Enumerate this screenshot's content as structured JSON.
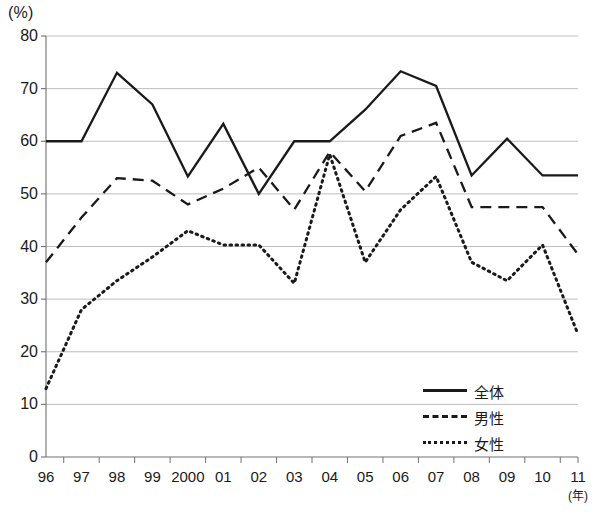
{
  "axis": {
    "y_unit": "(%)",
    "x_unit": "(年)",
    "y_ticks": [
      "80",
      "70",
      "60",
      "50",
      "40",
      "30",
      "20",
      "10",
      "0"
    ],
    "x_ticks": [
      "96",
      "97",
      "98",
      "99",
      "2000",
      "01",
      "02",
      "03",
      "04",
      "05",
      "06",
      "07",
      "08",
      "09",
      "10",
      "11"
    ]
  },
  "legend": {
    "items": [
      {
        "label": "全体",
        "style": "solid"
      },
      {
        "label": "男性",
        "style": "dashed"
      },
      {
        "label": "女性",
        "style": "dotted"
      }
    ]
  },
  "colors": {
    "line": "#1a1a1a",
    "grid": "#b5b5b5",
    "axis": "#707070",
    "background": "#ffffff"
  },
  "chart_data": {
    "type": "line",
    "title": "",
    "xlabel": "(年)",
    "ylabel": "(%)",
    "xlim": [
      0,
      15
    ],
    "ylim": [
      0,
      80
    ],
    "grid": true,
    "legend_position": "inside-lower-right",
    "categories": [
      "96",
      "97",
      "98",
      "99",
      "2000",
      "01",
      "02",
      "03",
      "04",
      "05",
      "06",
      "07",
      "08",
      "09",
      "10",
      "11"
    ],
    "series": [
      {
        "name": "全体",
        "style": "solid",
        "values": [
          60.0,
          60.0,
          73.0,
          67.0,
          53.3,
          63.3,
          50.0,
          60.0,
          60.0,
          66.0,
          73.3,
          70.5,
          53.5,
          60.5,
          53.5,
          53.5
        ]
      },
      {
        "name": "男性",
        "style": "dashed",
        "values": [
          37.0,
          45.5,
          53.0,
          52.5,
          48.0,
          51.0,
          55.0,
          47.0,
          58.0,
          50.5,
          61.0,
          63.5,
          47.5,
          47.5,
          47.5,
          38.5
        ]
      },
      {
        "name": "女性",
        "style": "dotted",
        "values": [
          13.0,
          28.0,
          33.5,
          38.0,
          43.0,
          40.3,
          40.3,
          33.0,
          57.5,
          37.0,
          47.0,
          53.3,
          37.0,
          33.5,
          40.3,
          23.3
        ]
      }
    ]
  }
}
